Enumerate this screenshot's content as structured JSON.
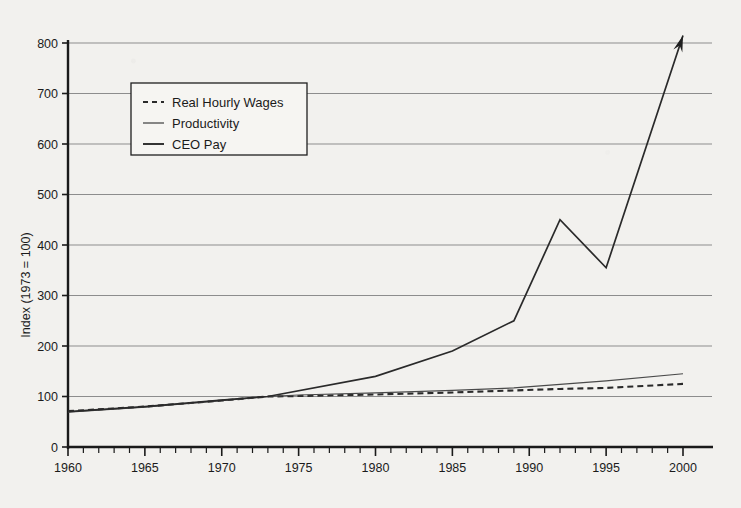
{
  "chart_data": {
    "type": "line",
    "title": "",
    "xlabel": "",
    "ylabel": "Index (1973 = 100)",
    "xlim": [
      1960,
      2000
    ],
    "ylim": [
      0,
      800
    ],
    "grid": true,
    "legend_position": "upper-left",
    "y_ticks": [
      0,
      100,
      200,
      300,
      400,
      500,
      600,
      700,
      800
    ],
    "y_tick_labels": [
      "0",
      "100",
      "200",
      "300",
      "400",
      "500",
      "600",
      "700",
      "800"
    ],
    "x_ticks": [
      1960,
      1965,
      1970,
      1975,
      1980,
      1985,
      1990,
      1995,
      2000
    ],
    "x_tick_labels": [
      "1960",
      "1965",
      "1970",
      "1975",
      "1980",
      "1985",
      "1990",
      "1995",
      "2000"
    ],
    "x_minor_tick_interval": 1,
    "annotations": [
      {
        "name": "ceo-arrowhead",
        "text": "",
        "x": 2000,
        "y": 815
      }
    ],
    "series": [
      {
        "name": "Real Hourly Wages",
        "style": "dashed",
        "color": "#2a2a2a",
        "x": [
          1960,
          1965,
          1970,
          1973,
          1975,
          1980,
          1985,
          1989,
          1992,
          1995,
          2000
        ],
        "values": [
          71,
          80,
          92,
          100,
          101,
          104,
          108,
          112,
          115,
          117,
          125
        ]
      },
      {
        "name": "Productivity",
        "style": "solid-thin",
        "color": "#4a4a4a",
        "x": [
          1960,
          1965,
          1970,
          1973,
          1975,
          1980,
          1985,
          1989,
          1992,
          1995,
          2000
        ],
        "values": [
          69,
          79,
          92,
          100,
          103,
          107,
          112,
          117,
          124,
          131,
          145
        ]
      },
      {
        "name": "CEO Pay",
        "style": "solid-thick",
        "color": "#2a2a2a",
        "x": [
          1960,
          1965,
          1970,
          1973,
          1980,
          1985,
          1989,
          1992,
          1995,
          2000
        ],
        "values": [
          70,
          80,
          93,
          100,
          140,
          190,
          250,
          450,
          355,
          815
        ]
      }
    ]
  },
  "legend": {
    "entries": [
      {
        "label": "Real Hourly Wages",
        "style": "dashed"
      },
      {
        "label": "Productivity",
        "style": "solid-thin"
      },
      {
        "label": "CEO Pay",
        "style": "solid-thick"
      }
    ]
  },
  "colors": {
    "background": "#f2f1ee",
    "gridline": "#8d8d8d",
    "axis": "#1a1a1a",
    "text": "#1b1b1b"
  }
}
